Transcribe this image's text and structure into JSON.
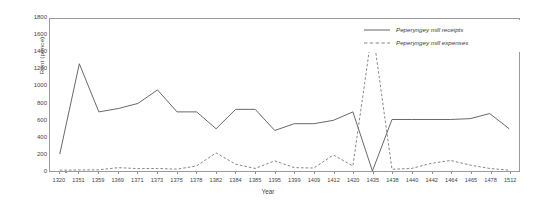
{
  "chart_data": {
    "type": "line",
    "title": "",
    "xlabel": "Year",
    "ylabel": "Rent (pence)",
    "ylim": [
      0,
      1800
    ],
    "ytick_step": 200,
    "yticks": [
      0,
      200,
      400,
      600,
      800,
      1000,
      1200,
      1400,
      1600,
      1800
    ],
    "grid": false,
    "legend_position": "top-right-inside",
    "categories": [
      "1320",
      "1351",
      "1359",
      "1369",
      "1371",
      "1373",
      "1375",
      "1378",
      "1382",
      "1384",
      "1385",
      "1395",
      "1399",
      "1409",
      "1412",
      "1420",
      "1435",
      "1438",
      "1440",
      "1442",
      "1464",
      "1465",
      "1478",
      "1512"
    ],
    "series": [
      {
        "name": "Peperyngey mill receipts",
        "style": "solid",
        "color": "#555555",
        "values": [
          200,
          1270,
          700,
          740,
          800,
          960,
          700,
          700,
          500,
          730,
          730,
          480,
          560,
          560,
          600,
          700,
          0,
          610,
          610,
          610,
          610,
          620,
          680,
          500
        ]
      },
      {
        "name": "Peperyngey mill expenses",
        "style": "dashed",
        "color": "#777777",
        "values": [
          10,
          12,
          14,
          40,
          28,
          30,
          22,
          60,
          215,
          80,
          30,
          120,
          40,
          35,
          190,
          60,
          1690,
          20,
          30,
          90,
          125,
          70,
          30,
          10
        ]
      }
    ]
  },
  "legend": {
    "items": [
      {
        "label": "Peperyngey mill receipts",
        "style": "solid"
      },
      {
        "label": "Peperyngey mill expenses",
        "style": "dashed"
      }
    ]
  },
  "axes": {
    "x_title": "Year",
    "y_title": "Rent (pence)"
  }
}
